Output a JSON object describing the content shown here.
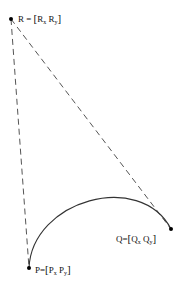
{
  "diagram": {
    "type": "quadratic-bezier-construction",
    "points": {
      "R": {
        "name": "R",
        "x_sub": "x",
        "y_sub": "y",
        "px": [
          11,
          19
        ]
      },
      "P": {
        "name": "P",
        "x_sub": "x",
        "y_sub": "y",
        "px": [
          29,
          268
        ]
      },
      "Q": {
        "name": "Q",
        "x_sub": "x",
        "y_sub": "y",
        "px": [
          171,
          229
        ]
      }
    },
    "labels": {
      "R": {
        "head": "R",
        "eq": "=",
        "lb": "[",
        "a": "R",
        "a_sub": "x",
        "b": "R",
        "b_sub": "y",
        "rb": "]"
      },
      "P": {
        "head": "P",
        "eq": "=",
        "lb": "[",
        "a": "P",
        "a_sub": "x",
        "b": "P",
        "b_sub": "y",
        "rb": "]"
      },
      "Q": {
        "head": "Q",
        "eq": "=",
        "lb": "[",
        "a": "Q",
        "a_sub": "x",
        "b": "Q",
        "b_sub": "y",
        "rb": "]"
      }
    },
    "colors": {
      "line": "#333333",
      "dash": "#555555",
      "point": "#000000"
    }
  }
}
